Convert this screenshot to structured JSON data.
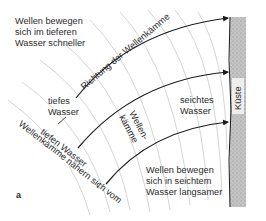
{
  "figure": {
    "panel_letter": "a",
    "labels": {
      "deep_fast_line1": "Wellen bewegen",
      "deep_fast_line2": "sich im tieferen",
      "deep_fast_line3": "Wasser schneller",
      "direction": "Richtung der Wellenkämme",
      "deep_water_line1": "tiefes",
      "deep_water_line2": "Wasser",
      "approach_line1": "Wellenkämme nähern sich vom",
      "approach_line2": "tiefen Wasser",
      "crests_line1": "Wellen-",
      "crests_line2": "kämme",
      "shallow_water_line1": "seichtes",
      "shallow_water_line2": "Wasser",
      "shallow_slow_line1": "Wellen bewegen",
      "shallow_slow_line2": "sich in seichtem",
      "shallow_slow_line3": "Wasser langsamer",
      "coast": "Küste"
    },
    "colors": {
      "coast_fill": "#b8b8b8",
      "ray": "#1a1a1a",
      "crest": "#c9c9c9",
      "text": "#2a2a2a"
    }
  }
}
